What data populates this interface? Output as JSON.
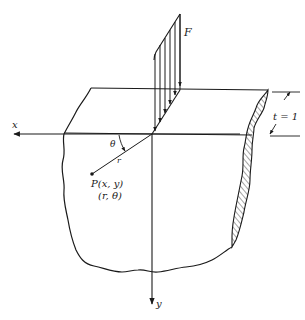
{
  "diagram": {
    "labels": {
      "force": "F",
      "thickness": "t = 1",
      "x_axis": "x",
      "y_axis": "y",
      "angle": "θ",
      "radius": "r",
      "point_cartesian": "P(x, y)",
      "point_polar": "(r, θ)"
    },
    "colors": {
      "ink": "#1a1a1a",
      "background": "#ffffff"
    }
  }
}
